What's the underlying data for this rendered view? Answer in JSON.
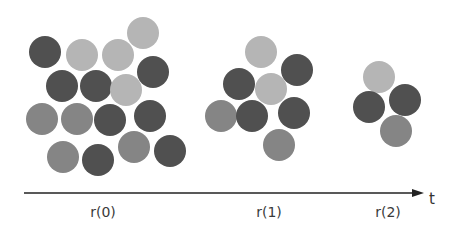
{
  "colors": {
    "dark": "#505050",
    "mid": "#858585",
    "light": "#b5b5b5",
    "axis": "#222222"
  },
  "radius": 16,
  "groups": [
    {
      "label": "r(0)",
      "label_x": 103,
      "circles": [
        {
          "x": 45,
          "y": 52,
          "shade": "dark"
        },
        {
          "x": 82,
          "y": 55,
          "shade": "light"
        },
        {
          "x": 118,
          "y": 55,
          "shade": "light"
        },
        {
          "x": 143,
          "y": 33,
          "shade": "light"
        },
        {
          "x": 153,
          "y": 72,
          "shade": "dark"
        },
        {
          "x": 62,
          "y": 86,
          "shade": "dark"
        },
        {
          "x": 96,
          "y": 86,
          "shade": "dark"
        },
        {
          "x": 126,
          "y": 90,
          "shade": "light"
        },
        {
          "x": 42,
          "y": 119,
          "shade": "mid"
        },
        {
          "x": 77,
          "y": 119,
          "shade": "mid"
        },
        {
          "x": 110,
          "y": 120,
          "shade": "dark"
        },
        {
          "x": 150,
          "y": 116,
          "shade": "dark"
        },
        {
          "x": 63,
          "y": 157,
          "shade": "mid"
        },
        {
          "x": 98,
          "y": 160,
          "shade": "dark"
        },
        {
          "x": 134,
          "y": 147,
          "shade": "mid"
        },
        {
          "x": 170,
          "y": 151,
          "shade": "dark"
        }
      ]
    },
    {
      "label": "r(1)",
      "label_x": 269,
      "circles": [
        {
          "x": 261,
          "y": 52,
          "shade": "light"
        },
        {
          "x": 297,
          "y": 70,
          "shade": "dark"
        },
        {
          "x": 239,
          "y": 84,
          "shade": "dark"
        },
        {
          "x": 271,
          "y": 89,
          "shade": "light"
        },
        {
          "x": 221,
          "y": 116,
          "shade": "mid"
        },
        {
          "x": 252,
          "y": 116,
          "shade": "dark"
        },
        {
          "x": 294,
          "y": 113,
          "shade": "dark"
        },
        {
          "x": 279,
          "y": 145,
          "shade": "mid"
        }
      ]
    },
    {
      "label": "r(2)",
      "label_x": 388,
      "circles": [
        {
          "x": 379,
          "y": 77,
          "shade": "light"
        },
        {
          "x": 369,
          "y": 107,
          "shade": "dark"
        },
        {
          "x": 405,
          "y": 100,
          "shade": "dark"
        },
        {
          "x": 396,
          "y": 131,
          "shade": "mid"
        }
      ]
    }
  ],
  "axis": {
    "x1": 24,
    "x2": 424,
    "y": 193,
    "label": "t"
  }
}
